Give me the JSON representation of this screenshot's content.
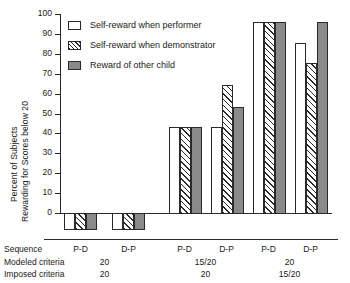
{
  "chart_data": {
    "type": "bar",
    "title": "",
    "xlabel": "",
    "ylabel": "Percent of Subjects Rewarding for Scores below 20",
    "ylabel_line1": "Percent of Subjects",
    "ylabel_line2": "Rewarding for Scores below 20",
    "ylim": [
      0,
      100
    ],
    "ytick_labels": [
      "100",
      "90",
      "80",
      "70",
      "60",
      "50",
      "40",
      "30",
      "20",
      "10",
      "0"
    ],
    "ytick_values": [
      100,
      90,
      80,
      70,
      60,
      50,
      40,
      30,
      20,
      10,
      0
    ],
    "grid": false,
    "legend_position": "top-left",
    "categories": [
      "P-D",
      "D-P",
      "P-D",
      "D-P",
      "P-D",
      "D-P"
    ],
    "series": [
      {
        "name": "Self-reward when performer",
        "pattern": "open",
        "values": [
          0,
          0,
          43.5,
          43.5,
          96.5,
          86
        ]
      },
      {
        "name": "Self-reward when demonstrator",
        "pattern": "hatched",
        "values": [
          0,
          0,
          43.5,
          65,
          96.5,
          76
        ]
      },
      {
        "name": "Reward of other child",
        "pattern": "solid-gray",
        "values": [
          0,
          0,
          43.5,
          54,
          96.5,
          96.5
        ]
      }
    ],
    "colors": {
      "open": "#ffffff",
      "hatched": "#ffffff",
      "solid_gray": "#8a8a8a",
      "outline": "#2a2a2a",
      "background": "#ffffff"
    },
    "axis_rows": [
      {
        "label": "Sequence",
        "values": [
          "P-D",
          "D-P",
          "P-D",
          "D-P",
          "P-D",
          "D-P"
        ]
      },
      {
        "label": "Modeled criteria",
        "values": [
          "20",
          "15/20",
          "20"
        ],
        "spans": [
          2,
          2,
          2
        ]
      },
      {
        "label": "Imposed criteria",
        "values": [
          "20",
          "20",
          "15/20"
        ],
        "spans": [
          2,
          2,
          2
        ]
      }
    ]
  },
  "legend": {
    "items": [
      {
        "label": "Self-reward when performer"
      },
      {
        "label": "Self-reward when demonstrator"
      },
      {
        "label": "Reward of other child"
      }
    ]
  }
}
